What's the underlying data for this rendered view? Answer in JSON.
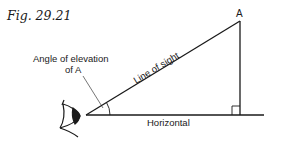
{
  "figure": {
    "title": "Fig. 29.21",
    "labels": {
      "point": "A",
      "angle_line1": "Angle of elevation",
      "angle_line2": "of A",
      "hypotenuse": "Line of sight",
      "base": "Horizontal"
    },
    "colors": {
      "ink": "#1a1a1a",
      "background": "#ffffff"
    }
  }
}
